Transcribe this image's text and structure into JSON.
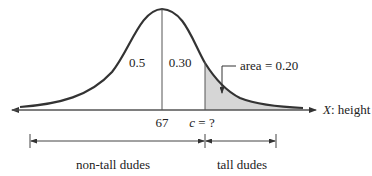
{
  "diagram": {
    "type": "normal-distribution",
    "mean_label": "67",
    "cutoff_label": "c = ?",
    "cutoff_var": "c",
    "cutoff_rest": " = ?",
    "left_half_area": "0.5",
    "middle_area": "0.30",
    "tail_area_label": "area = 0.20",
    "axis_label_var": "X",
    "axis_label_rest": ": height",
    "bracket_left_label": "non-tall dudes",
    "bracket_right_label": "tall dudes",
    "colors": {
      "curve": "#333333",
      "axis": "#555555",
      "shade": "#d6d6d6",
      "text": "#222222"
    }
  }
}
